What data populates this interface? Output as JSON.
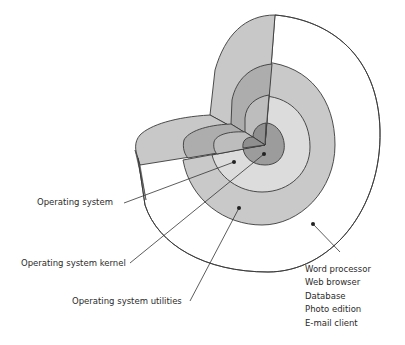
{
  "diagram": {
    "type": "concentric-layer-cutaway",
    "layers": [
      {
        "id": "kernel",
        "label": "Operating system kernel",
        "fill": "#9c9c9c"
      },
      {
        "id": "os",
        "label": "Operating system",
        "fill": "#dcdcdc"
      },
      {
        "id": "utilities",
        "label": "Operating system utilities",
        "fill": "#c9c9c9"
      },
      {
        "id": "applications",
        "label": "Applications",
        "fill": "#ffffff"
      }
    ],
    "colors": {
      "outline": "#3a3a3a",
      "wall_light": "#c8c8c8",
      "wall_mid": "#adadad",
      "wall_dark": "#8f8f8f",
      "background": "#ffffff"
    }
  },
  "labels": {
    "operating_system": "Operating system",
    "kernel": "Operating system kernel",
    "utilities": "Operating system utilities"
  },
  "applications": {
    "items": [
      "Word processor",
      "Web browser",
      "Database",
      "Photo edition",
      "E-mail client"
    ]
  }
}
